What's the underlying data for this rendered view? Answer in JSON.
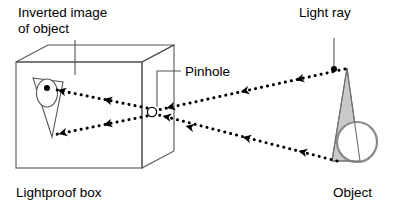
{
  "figure": {
    "kind": "pinhole-camera-diagram",
    "background_color": "#ffffff",
    "line_color": "#000000",
    "box_line_color": "#4a4a4a",
    "object_fill_color": "#c9c9c9",
    "circle_fill_color": "#ffffff",
    "width": 398,
    "height": 206
  },
  "labels": {
    "inverted_image_line1": "Inverted image",
    "inverted_image_line2": "of object",
    "pinhole": "Pinhole",
    "light_ray": "Light ray",
    "lightproof_box": "Lightproof box",
    "object": "Object"
  },
  "diagram_data": {
    "type": "ray-diagram",
    "elements": [
      {
        "name": "lightproof-box",
        "shape": "rectangular-prism-perspective",
        "front_face": [
          [
            16,
            62
          ],
          [
            142,
            62
          ],
          [
            142,
            168
          ],
          [
            16,
            168
          ]
        ],
        "depth_offset": [
          32,
          -17
        ]
      },
      {
        "name": "pinhole",
        "shape": "small-circle",
        "center": [
          152,
          112
        ],
        "radius": 4.5
      },
      {
        "name": "object",
        "shape": "cone-with-sphere",
        "cone_apex": [
          347,
          68
        ],
        "cone_base": [
          [
            333,
            161
          ],
          [
            359,
            161
          ]
        ],
        "sphere_center": [
          357,
          142
        ],
        "sphere_radius": 20
      },
      {
        "name": "inverted-image",
        "shape": "inverted-cone-with-ellipse",
        "cone_apex": [
          52,
          137
        ],
        "cone_base": [
          [
            33,
            78
          ],
          [
            62,
            82
          ]
        ],
        "ellipse_center": [
          47,
          92
        ],
        "ellipse_radii": [
          10,
          14
        ]
      }
    ],
    "rays": [
      {
        "name": "ray-object-top-to-pinhole",
        "from": [
          345,
          69
        ],
        "to": [
          157,
          110
        ],
        "direction": "right-to-left",
        "arrowheads": 3,
        "style": "dotted"
      },
      {
        "name": "ray-object-bottom-to-pinhole",
        "from": [
          337,
          161
        ],
        "to": [
          158,
          115
        ],
        "direction": "right-to-left",
        "arrowheads": 3,
        "style": "dotted"
      },
      {
        "name": "ray-pinhole-to-image-top",
        "from": [
          148,
          108
        ],
        "to": [
          50,
          88
        ],
        "direction": "right-to-left",
        "arrowheads": 2,
        "style": "dotted"
      },
      {
        "name": "ray-pinhole-to-image-bottom",
        "from": [
          148,
          116
        ],
        "to": [
          50,
          136
        ],
        "direction": "right-to-left",
        "arrowheads": 2,
        "style": "dotted"
      }
    ],
    "leader_lines": [
      {
        "name": "leader-inverted-image",
        "path": [
          [
            75,
            46
          ],
          [
            75,
            74
          ]
        ],
        "endpoint_marker": "none"
      },
      {
        "name": "leader-pinhole",
        "path": [
          [
            178,
            72
          ],
          [
            157,
            72
          ],
          [
            157,
            108
          ]
        ],
        "endpoint_marker": "none"
      },
      {
        "name": "leader-light-ray",
        "path": [
          [
            334,
            44
          ],
          [
            334,
            70
          ]
        ],
        "endpoint_marker": "dot"
      }
    ],
    "label_positions": {
      "inverted_image_line1": [
        18,
        16
      ],
      "inverted_image_line2": [
        18,
        32
      ],
      "pinhole": [
        183,
        77
      ],
      "light_ray": [
        300,
        16
      ],
      "lightproof_box": [
        16,
        196
      ],
      "object": [
        334,
        196
      ]
    }
  }
}
